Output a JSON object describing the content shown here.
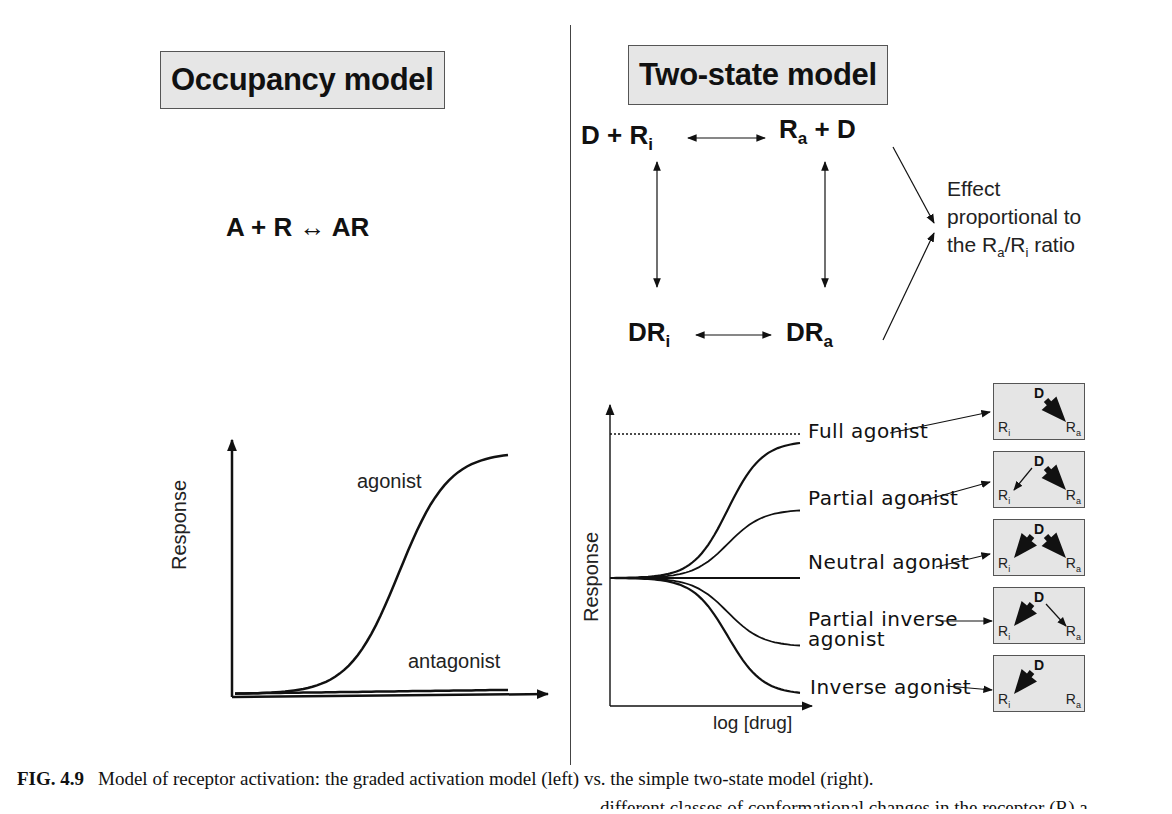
{
  "left_panel": {
    "title": "Occupancy model",
    "equation": "A + R ↔ AR",
    "graph": {
      "ylabel": "Response",
      "curves": [
        {
          "name": "agonist",
          "label": "agonist",
          "shape": "sigmoid-rise",
          "max_response_fraction": 0.92
        },
        {
          "name": "antagonist",
          "label": "antagonist",
          "shape": "flat",
          "max_response_fraction": 0.03
        }
      ]
    }
  },
  "right_panel": {
    "title": "Two-state model",
    "scheme": {
      "top_left": {
        "main": "D + R",
        "sub": "i"
      },
      "top_right": {
        "main": "R",
        "sub": "a",
        "suffix": " + D"
      },
      "bottom_left": {
        "main": "DR",
        "sub": "i"
      },
      "bottom_right": {
        "main": "DR",
        "sub": "a"
      }
    },
    "effect_note": {
      "line1": "Effect",
      "line2": "proportional to",
      "line3_prefix": "the R",
      "line3_sub_a": "a",
      "line3_mid": "/R",
      "line3_sub_i": "i",
      "line3_suffix": " ratio"
    },
    "graph": {
      "ylabel": "Response",
      "xlabel": "log [drug]",
      "curves": [
        {
          "name": "full-agonist",
          "label": "Full agonist",
          "level": 1.0
        },
        {
          "name": "partial-agonist",
          "label": "Partial agonist",
          "level": 0.5
        },
        {
          "name": "neutral-agonist",
          "label": "Neutral agonist",
          "level": 0.0
        },
        {
          "name": "partial-inverse-agonist",
          "label_line1": "Partial inverse",
          "label_line2": "agonist",
          "level": -0.5
        },
        {
          "name": "inverse-agonist",
          "label": "Inverse agonist",
          "level": -0.85
        }
      ]
    },
    "mini_boxes": [
      {
        "name": "full-agonist",
        "d": "D",
        "ri": "R",
        "ri_sub": "i",
        "ra": "R",
        "ra_sub": "a",
        "to_ri": "none",
        "to_ra": "large"
      },
      {
        "name": "partial-agonist",
        "d": "D",
        "ri": "R",
        "ri_sub": "i",
        "ra": "R",
        "ra_sub": "a",
        "to_ri": "small",
        "to_ra": "large"
      },
      {
        "name": "neutral-agonist",
        "d": "D",
        "ri": "R",
        "ri_sub": "i",
        "ra": "R",
        "ra_sub": "a",
        "to_ri": "large",
        "to_ra": "large"
      },
      {
        "name": "partial-inverse-agonist",
        "d": "D",
        "ri": "R",
        "ri_sub": "i",
        "ra": "R",
        "ra_sub": "a",
        "to_ri": "large",
        "to_ra": "small"
      },
      {
        "name": "inverse-agonist",
        "d": "D",
        "ri": "R",
        "ri_sub": "i",
        "ra": "R",
        "ra_sub": "a",
        "to_ri": "large",
        "to_ra": "none"
      }
    ]
  },
  "caption": {
    "figure_label": "FIG. 4.9",
    "line1": "Model of receptor activation: the graded activation model (left) vs. the simple two-state model (right).",
    "line2_partial": "different classes of conformational changes in the receptor (R) a"
  }
}
